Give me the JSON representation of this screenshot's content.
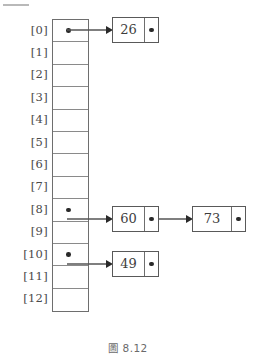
{
  "figure": {
    "caption": "圖 8.12",
    "colors": {
      "ink": "#3d3d3d",
      "box_border": "#595959",
      "array_border": "#6e6e6e",
      "slot_divider": "#8a8a8a",
      "dot": "#2a2a2a",
      "label": "#4a4a4a",
      "caption": "#6a6a6a",
      "background": "#ffffff"
    }
  },
  "array": {
    "name": "hash-table-array",
    "slot_count": 13,
    "slots": [
      {
        "label": "[0]",
        "index": 0,
        "has_pointer": true
      },
      {
        "label": "[1]",
        "index": 1,
        "has_pointer": false
      },
      {
        "label": "[2]",
        "index": 2,
        "has_pointer": false
      },
      {
        "label": "[3]",
        "index": 3,
        "has_pointer": false
      },
      {
        "label": "[4]",
        "index": 4,
        "has_pointer": false
      },
      {
        "label": "[5]",
        "index": 5,
        "has_pointer": false
      },
      {
        "label": "[6]",
        "index": 6,
        "has_pointer": false
      },
      {
        "label": "[7]",
        "index": 7,
        "has_pointer": false
      },
      {
        "label": "[8]",
        "index": 8,
        "has_pointer": true
      },
      {
        "label": "[9]",
        "index": 9,
        "has_pointer": false
      },
      {
        "label": "[10]",
        "index": 10,
        "has_pointer": true
      },
      {
        "label": "[11]",
        "index": 11,
        "has_pointer": false
      },
      {
        "label": "[12]",
        "index": 12,
        "has_pointer": false
      }
    ]
  },
  "chains": [
    {
      "slot_index": 0,
      "nodes": [
        {
          "value": "26",
          "has_next": false
        }
      ]
    },
    {
      "slot_index": 8,
      "nodes": [
        {
          "value": "60",
          "has_next": true
        },
        {
          "value": "73",
          "has_next": false
        }
      ]
    },
    {
      "slot_index": 10,
      "nodes": [
        {
          "value": "49",
          "has_next": false
        }
      ]
    }
  ],
  "nodes_flat": {
    "n0": "26",
    "n8a": "60",
    "n8b": "73",
    "n10": "49"
  }
}
